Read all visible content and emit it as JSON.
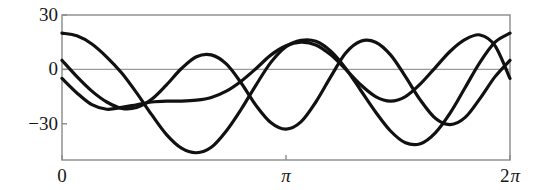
{
  "chart_data": {
    "type": "line",
    "title": "",
    "subtitle": "",
    "xlabel": "",
    "ylabel": "",
    "xlim": [
      0,
      6.283185307179586
    ],
    "ylim": [
      -50,
      30
    ],
    "grid": false,
    "legend": null,
    "legend_position": "none",
    "frame": true,
    "zero_line": true,
    "background": "#ffffff",
    "line_color": "#111111",
    "frame_color": "#8a8a8a",
    "axis_color": "#9a9a9a",
    "xticks": [
      {
        "value": 0,
        "label": "0",
        "coefficient": "",
        "symbol": ""
      },
      {
        "value": 3.141592653589793,
        "label": "π",
        "coefficient": "",
        "symbol": "π"
      },
      {
        "value": 6.283185307179586,
        "label": "2 π",
        "coefficient": "2",
        "symbol": "π"
      }
    ],
    "yticks": [
      {
        "value": 30,
        "label": "30"
      },
      {
        "value": 0,
        "label": "0"
      },
      {
        "value": -30,
        "label": "-30"
      }
    ],
    "series": [
      {
        "name": "curve-1",
        "color": "#111111",
        "linewidth": 3.2,
        "description": "starts near +20, dips to about -46 near x=1.7, rises to +16 near x=3.5, dips to about -41 near x=5.0, rises back to +20 at 2π",
        "x": [
          0.0,
          0.209,
          0.419,
          0.628,
          0.838,
          1.047,
          1.257,
          1.466,
          1.676,
          1.885,
          2.094,
          2.304,
          2.513,
          2.723,
          2.932,
          3.142,
          3.351,
          3.56,
          3.77,
          3.979,
          4.189,
          4.398,
          4.608,
          4.817,
          5.027,
          5.236,
          5.445,
          5.655,
          5.864,
          6.074,
          6.283
        ],
        "y": [
          20.0,
          18.5,
          14.0,
          6.8,
          -2.0,
          -13.0,
          -25.0,
          -36.0,
          -43.5,
          -46.0,
          -43.0,
          -34.0,
          -22.0,
          -8.5,
          4.0,
          12.5,
          16.0,
          15.5,
          10.0,
          0.5,
          -11.5,
          -23.5,
          -34.0,
          -40.5,
          -41.0,
          -35.0,
          -24.0,
          -10.0,
          4.0,
          15.0,
          20.0
        ]
      },
      {
        "name": "curve-2",
        "color": "#111111",
        "linewidth": 3.2,
        "description": "starts near +5, falls to about -22 near x=0.9, peaks +8 near x=1.9, dips -33 near x=3.0, peaks +16 near x=4.0, dips -30 near x=5.3, returns to +5",
        "x": [
          0.0,
          0.209,
          0.419,
          0.628,
          0.838,
          1.047,
          1.257,
          1.466,
          1.676,
          1.885,
          2.094,
          2.304,
          2.513,
          2.723,
          2.932,
          3.142,
          3.351,
          3.56,
          3.77,
          3.979,
          4.189,
          4.398,
          4.608,
          4.817,
          5.027,
          5.236,
          5.445,
          5.655,
          5.864,
          6.074,
          6.283
        ],
        "y": [
          5.0,
          -4.0,
          -12.0,
          -18.0,
          -21.5,
          -21.0,
          -16.5,
          -8.5,
          0.5,
          7.0,
          8.0,
          3.0,
          -7.5,
          -20.0,
          -29.5,
          -33.0,
          -29.0,
          -18.0,
          -4.0,
          9.0,
          15.5,
          15.0,
          8.0,
          -4.0,
          -17.0,
          -27.0,
          -30.5,
          -26.5,
          -16.0,
          -4.0,
          5.0
        ]
      },
      {
        "name": "curve-3",
        "color": "#111111",
        "linewidth": 3.2,
        "description": "starts near -5, dips -22 near x=0.6, slowly rises through -15 to peak +15 near x=3.3, dips -17 near x=4.6, rises to +19 near x=5.8, ends near -5",
        "x": [
          0.0,
          0.209,
          0.419,
          0.628,
          0.838,
          1.047,
          1.257,
          1.466,
          1.676,
          1.885,
          2.094,
          2.304,
          2.513,
          2.723,
          2.932,
          3.142,
          3.351,
          3.56,
          3.77,
          3.979,
          4.189,
          4.398,
          4.608,
          4.817,
          5.027,
          5.236,
          5.445,
          5.655,
          5.864,
          6.074,
          6.283
        ],
        "y": [
          -5.0,
          -13.0,
          -19.5,
          -22.0,
          -21.0,
          -19.5,
          -18.0,
          -17.5,
          -17.5,
          -17.0,
          -15.5,
          -12.0,
          -6.5,
          0.5,
          8.0,
          13.0,
          15.0,
          13.5,
          8.0,
          0.0,
          -8.5,
          -15.0,
          -17.5,
          -15.0,
          -8.0,
          1.0,
          10.0,
          16.5,
          19.0,
          13.0,
          -5.0
        ]
      }
    ]
  },
  "axes_geometry": {
    "plot_left_px": 62,
    "plot_right_px": 510,
    "plot_top_px": 15,
    "plot_bottom_px": 160
  }
}
